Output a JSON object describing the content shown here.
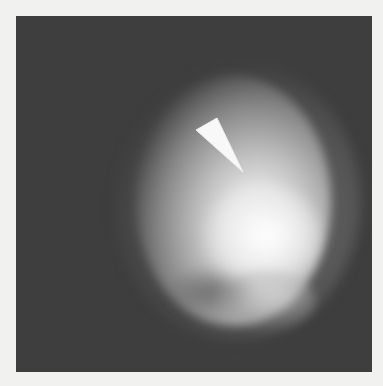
{
  "image": {
    "subject": "planetary-disk",
    "description": "Grayscale image of a partially illuminated planetary disk on a dark background with a white triangular arrow marker pointing at a bright region",
    "colors": {
      "page_background": "#f1f1ef",
      "panel_background": "#3e3e3e",
      "disk_highlight": "#f4f4f4",
      "marker": "#f8f8f8"
    },
    "marker": {
      "shape": "triangle-arrow",
      "points": [
        [
          180,
          114
        ],
        [
          201,
          102
        ],
        [
          227,
          156
        ]
      ]
    }
  }
}
